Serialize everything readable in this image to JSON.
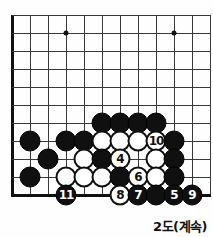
{
  "figure": {
    "caption": "2도(계속)",
    "board": {
      "cell": 18,
      "origin_x": 12,
      "origin_y": 15,
      "cols": 12,
      "rows": 11,
      "left_edge": true,
      "top_edge": false,
      "bottom_edge": true,
      "star_points": [
        {
          "col": 3,
          "row": 1
        },
        {
          "col": 9,
          "row": 1
        }
      ]
    },
    "colors": {
      "black_stone": "#101010",
      "white_stone": "#ffffff",
      "line": "#3a3a3a",
      "edge": "#111111",
      "board_bg": "#fefefe"
    },
    "stones": [
      {
        "name": "black-stone",
        "color": "black",
        "col": 5,
        "row": 6,
        "label": ""
      },
      {
        "name": "black-stone",
        "color": "black",
        "col": 6,
        "row": 6,
        "label": ""
      },
      {
        "name": "black-stone",
        "color": "black",
        "col": 7,
        "row": 6,
        "label": ""
      },
      {
        "name": "black-stone",
        "color": "black",
        "col": 8,
        "row": 6,
        "label": ""
      },
      {
        "name": "black-stone",
        "color": "black",
        "col": 1,
        "row": 7,
        "label": ""
      },
      {
        "name": "black-stone",
        "color": "black",
        "col": 3,
        "row": 7,
        "label": ""
      },
      {
        "name": "black-stone",
        "color": "black",
        "col": 4,
        "row": 7,
        "label": ""
      },
      {
        "name": "white-stone",
        "color": "white",
        "col": 5,
        "row": 7,
        "label": ""
      },
      {
        "name": "white-stone",
        "color": "white",
        "col": 6,
        "row": 7,
        "label": ""
      },
      {
        "name": "white-stone",
        "color": "white",
        "col": 7,
        "row": 7,
        "label": ""
      },
      {
        "name": "white-stone-10",
        "color": "white",
        "col": 8,
        "row": 7,
        "label": "10"
      },
      {
        "name": "black-stone",
        "color": "black",
        "col": 9,
        "row": 7,
        "label": ""
      },
      {
        "name": "black-stone",
        "color": "black",
        "col": 2,
        "row": 8,
        "label": ""
      },
      {
        "name": "white-stone",
        "color": "white",
        "col": 4,
        "row": 8,
        "label": ""
      },
      {
        "name": "black-stone",
        "color": "black",
        "col": 5,
        "row": 8,
        "label": ""
      },
      {
        "name": "white-stone-4",
        "color": "white",
        "col": 6,
        "row": 8,
        "label": "4"
      },
      {
        "name": "white-stone",
        "color": "white",
        "col": 8,
        "row": 8,
        "label": ""
      },
      {
        "name": "black-stone",
        "color": "black",
        "col": 9,
        "row": 8,
        "label": ""
      },
      {
        "name": "black-stone",
        "color": "black",
        "col": 1,
        "row": 9,
        "label": ""
      },
      {
        "name": "white-stone",
        "color": "white",
        "col": 3,
        "row": 9,
        "label": ""
      },
      {
        "name": "white-stone",
        "color": "white",
        "col": 4,
        "row": 9,
        "label": ""
      },
      {
        "name": "white-stone",
        "color": "white",
        "col": 5,
        "row": 9,
        "label": ""
      },
      {
        "name": "black-stone",
        "color": "black",
        "col": 6,
        "row": 9,
        "label": ""
      },
      {
        "name": "white-stone-6",
        "color": "white",
        "col": 7,
        "row": 9,
        "label": "6"
      },
      {
        "name": "white-stone",
        "color": "white",
        "col": 8,
        "row": 9,
        "label": ""
      },
      {
        "name": "black-stone",
        "color": "black",
        "col": 9,
        "row": 9,
        "label": ""
      },
      {
        "name": "black-stone-11",
        "color": "black",
        "col": 3,
        "row": 10,
        "label": "11"
      },
      {
        "name": "white-stone-8",
        "color": "white",
        "col": 6,
        "row": 10,
        "label": "8"
      },
      {
        "name": "black-stone-7",
        "color": "black",
        "col": 7,
        "row": 10,
        "label": "7"
      },
      {
        "name": "black-stone",
        "color": "black",
        "col": 8,
        "row": 10,
        "label": ""
      },
      {
        "name": "black-stone-5",
        "color": "black",
        "col": 9,
        "row": 10,
        "label": "5"
      },
      {
        "name": "black-stone-9",
        "color": "black",
        "col": 10,
        "row": 10,
        "label": "9"
      }
    ]
  }
}
